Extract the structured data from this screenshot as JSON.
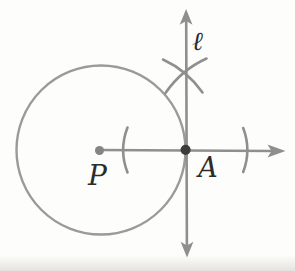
{
  "figure": {
    "type": "geometry-construction",
    "labels": {
      "center_point": "P",
      "tangent_point": "A",
      "line": "ℓ"
    },
    "colors": {
      "background": "#fdfdfb",
      "stroke": "#8f8f8f",
      "stroke_light": "#9a9a9a",
      "point_dark": "#3d3d3d",
      "point_gray": "#858585",
      "label": "#2c2c2c"
    },
    "geometry": {
      "circle": {
        "cx": 101,
        "cy": 150,
        "r": 84.5
      },
      "point_P": {
        "x": 99.5,
        "y": 150.5
      },
      "point_A": {
        "x": 185.6,
        "y": 149.8
      },
      "tick_left_x": 123,
      "tick_right_x": 247,
      "cross_point": {
        "x": 184.5,
        "y": 74
      }
    },
    "paths": {
      "circle": "M16.5,150 a84.5,84.5 0 1,0 169,0 a84.5,84.5 0 1,0 -169,0",
      "horizontal_ray": "M100,150 L272.5,151",
      "horizontal_arrow": "M285.5,151 L267.5,144.4 L271.5,151 L267.5,157.6 Z",
      "vertical_line": "M186.2,20.5 L186.9,246.5",
      "vertical_arrow_up": "M186.1,9 L179.7,24.8 L186.1,21 L192.5,24.8 Z",
      "vertical_arrow_down": "M187,257.5 L180.6,241.8 L187,245.6 L193.4,241.8 Z",
      "tick_left": "M127.5,127.5 A62,62 0 0,0 127.5,172.5",
      "tick_right": "M243.2,128 A62,62 0 0,1 243.2,172",
      "cross_arc_left": "M163,59.5 A98,98 0 0,1 202.5,92.5",
      "cross_arc_right": "M165.5,93 A99.5,99.5 0 0,1 206.5,58.5",
      "dot_P": "M99.5,150.5 m-4.5,0 a4.5,4.5 0 1,0 9,0 a4.5,4.5 0 1,0 -9,0",
      "dot_A": "M185.6,149.8 m-5.1,0 a5.1,5.1 0 1,0 10.2,0 a5.1,5.1 0 1,0 -10.2,0"
    },
    "label_positions": {
      "P": {
        "x": 97.5,
        "y": 185
      },
      "A": {
        "x": 208,
        "y": 177
      },
      "l": {
        "x": 197.5,
        "y": 50
      }
    }
  }
}
